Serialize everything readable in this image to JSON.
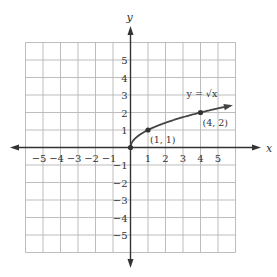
{
  "chart_data": {
    "type": "line",
    "title": "",
    "function_label": "y = √x",
    "xlabel": "x",
    "ylabel": "y",
    "xlim": [
      -6,
      6
    ],
    "ylim": [
      -6,
      6
    ],
    "grid": true,
    "x_ticks": [
      -5,
      -4,
      -3,
      -2,
      -1,
      1,
      2,
      3,
      4,
      5
    ],
    "y_ticks": [
      -5,
      -4,
      -3,
      -2,
      -1,
      1,
      2,
      3,
      4,
      5
    ],
    "x_tick_labels": [
      "−5",
      "−4",
      "−3",
      "−2",
      "−1",
      "1",
      "2",
      "3",
      "4",
      "5"
    ],
    "y_tick_labels": [
      "−5",
      "−4",
      "−3",
      "−2",
      "−1",
      "1",
      "2",
      "3",
      "4",
      "5"
    ],
    "series": [
      {
        "name": "y = √x",
        "x": [
          0,
          0.25,
          0.5,
          1,
          2,
          3,
          4,
          5,
          5.8
        ],
        "y": [
          0,
          0.5,
          0.707,
          1,
          1.414,
          1.732,
          2,
          2.236,
          2.408
        ],
        "color": "#444444",
        "arrow_end": true
      }
    ],
    "points": [
      {
        "x": 0,
        "y": 0,
        "label": ""
      },
      {
        "x": 1,
        "y": 1,
        "label": "(1, 1)"
      },
      {
        "x": 4,
        "y": 2,
        "label": "(4, 2)"
      }
    ],
    "annotations": [
      {
        "text": "y = √x",
        "x": 3.2,
        "y": 2.9
      }
    ]
  },
  "colors": {
    "grid": "#b5b5b5",
    "axis": "#333333",
    "curve": "#444444"
  }
}
